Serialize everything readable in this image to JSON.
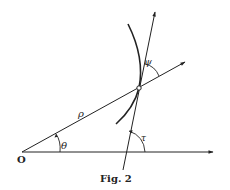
{
  "figure": {
    "caption": "Fig. 2",
    "labels": {
      "origin": "O",
      "radius": "ρ",
      "polar_angle": "θ",
      "angle_radius_tangent": "ψ",
      "tangent_angle": "τ"
    },
    "colors": {
      "ink": "#222222",
      "background": "#ffffff"
    }
  }
}
